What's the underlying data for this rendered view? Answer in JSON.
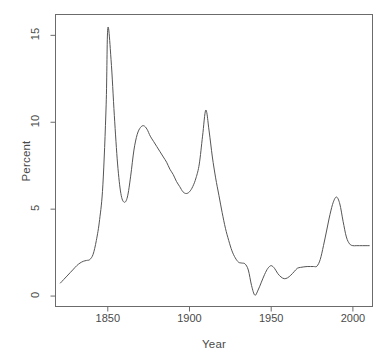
{
  "chart_data": {
    "type": "line",
    "title": "",
    "xlabel": "Year",
    "ylabel": "Percent",
    "xlim": [
      1818,
      2012
    ],
    "ylim": [
      -0.6,
      16.2
    ],
    "xticks": [
      1850,
      1900,
      1950,
      2000
    ],
    "xtick_labels": [
      "1850",
      "1900",
      "1950",
      "2000"
    ],
    "yticks": [
      0,
      5,
      10,
      15
    ],
    "ytick_labels": [
      "0",
      "5",
      "10",
      "15"
    ],
    "grid": false,
    "legend": null,
    "line_color": "#555555",
    "line_width": 1,
    "series": [
      {
        "name": "Percent",
        "x": [
          1821,
          1823,
          1825,
          1827,
          1829,
          1831,
          1833,
          1835,
          1837,
          1839,
          1841,
          1843,
          1845,
          1847,
          1849,
          1850,
          1852,
          1854,
          1856,
          1858,
          1860,
          1862,
          1864,
          1866,
          1868,
          1870,
          1872,
          1874,
          1876,
          1878,
          1880,
          1882,
          1884,
          1886,
          1888,
          1890,
          1892,
          1894,
          1896,
          1898,
          1900,
          1902,
          1904,
          1906,
          1908,
          1910,
          1912,
          1914,
          1916,
          1918,
          1920,
          1922,
          1924,
          1926,
          1928,
          1930,
          1932,
          1934,
          1936,
          1938,
          1940,
          1942,
          1944,
          1946,
          1948,
          1950,
          1952,
          1954,
          1956,
          1958,
          1960,
          1962,
          1964,
          1966,
          1968,
          1970,
          1972,
          1974,
          1976,
          1978,
          1980,
          1982,
          1984,
          1986,
          1988,
          1990,
          1992,
          1994,
          1996,
          1998,
          2000,
          2002,
          2004,
          2006,
          2008,
          2010
        ],
        "y": [
          0.75,
          0.95,
          1.15,
          1.35,
          1.55,
          1.75,
          1.9,
          2.0,
          2.05,
          2.1,
          2.4,
          3.2,
          4.4,
          6.4,
          11.0,
          15.4,
          13.6,
          10.4,
          7.6,
          5.9,
          5.4,
          5.7,
          6.9,
          8.4,
          9.3,
          9.7,
          9.8,
          9.6,
          9.2,
          8.9,
          8.6,
          8.3,
          8.0,
          7.7,
          7.3,
          7.0,
          6.6,
          6.3,
          6.0,
          5.9,
          6.0,
          6.3,
          6.8,
          7.6,
          9.2,
          10.7,
          9.5,
          8.0,
          6.8,
          5.8,
          4.8,
          3.9,
          3.2,
          2.6,
          2.2,
          1.95,
          1.9,
          1.85,
          1.5,
          0.6,
          0.05,
          0.35,
          0.8,
          1.25,
          1.6,
          1.75,
          1.6,
          1.3,
          1.1,
          1.0,
          1.05,
          1.2,
          1.4,
          1.6,
          1.65,
          1.68,
          1.7,
          1.7,
          1.7,
          1.72,
          2.1,
          2.9,
          3.8,
          4.7,
          5.4,
          5.7,
          5.3,
          4.3,
          3.4,
          3.0,
          2.9,
          2.9,
          2.9,
          2.9,
          2.9,
          2.9
        ]
      }
    ],
    "annotations": {
      "peak_1850": 15.4,
      "trough_1860": 5.4,
      "peak_1872": 9.8,
      "trough_1898": 5.9,
      "peak_1910": 10.7,
      "trough_1940": 0.05,
      "peak_1990": 5.7,
      "final_level": 2.9
    }
  },
  "axes": {
    "x_title": "Year",
    "y_title": "Percent"
  }
}
